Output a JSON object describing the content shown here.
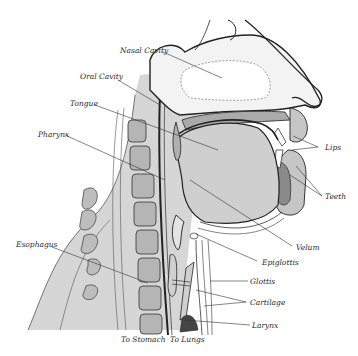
{
  "figure": {
    "colors": {
      "tissue_gray": "#c9c9c9",
      "light_gray": "#dcdcdc",
      "ink": "#2a2a2a",
      "background": "#ffffff"
    }
  },
  "labels": {
    "nasal_cavity": "Nasal Cavity",
    "oral_cavity": "Oral Cavity",
    "tongue": "Tongue",
    "pharynx": "Pharynx",
    "esophagus": "Esophagus",
    "lips": "Lips",
    "teeth": "Teeth",
    "velum": "Velum",
    "epiglottis": "Epiglottis",
    "glottis": "Glottis",
    "cartilage": "Cartilage",
    "larynx": "Larynx",
    "to_stomach": "To Stomach",
    "to_lungs": "To Lungs"
  }
}
